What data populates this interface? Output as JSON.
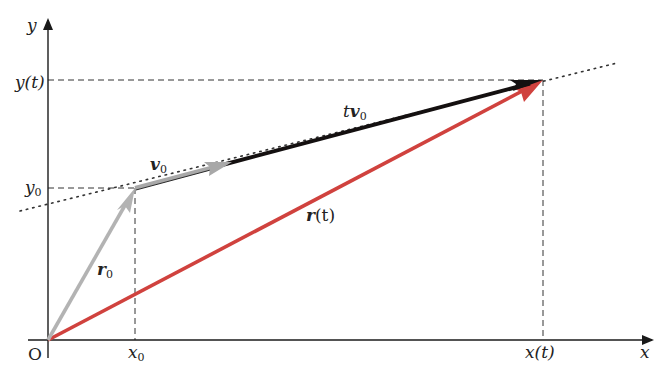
{
  "diagram": {
    "title": "",
    "type": "vector-kinematics",
    "colors": {
      "axis": "#1a1a1a",
      "dashed_guide": "#333333",
      "dotted_line": "#333333",
      "r0_vector": "#b3b3b3",
      "v0_vector": "#a8a8a8",
      "tv0_vector": "#141010",
      "rt_vector": "#d0423e",
      "background": "#ffffff"
    },
    "axes": {
      "x_label": "x",
      "y_label": "y",
      "origin_label": "O"
    },
    "ticks": {
      "x0": "x",
      "x0_sub": "0",
      "xt": "x(t)",
      "y0": "y",
      "y0_sub": "0",
      "yt": "y(t)"
    },
    "vectors": {
      "r0": {
        "label": "r",
        "sub": "0"
      },
      "v0": {
        "label": "v",
        "sub": "0"
      },
      "tv0": {
        "label_t": "t",
        "label": "v",
        "sub": "0"
      },
      "rt": {
        "label": "r",
        "suffix": "(t)"
      }
    },
    "points": {
      "origin": [
        48,
        340
      ],
      "p0": [
        135,
        188
      ],
      "v0_end": [
        228,
        163
      ],
      "pt": [
        543,
        80
      ]
    }
  }
}
